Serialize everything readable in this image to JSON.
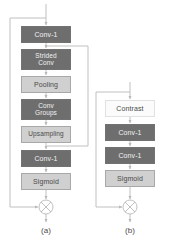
{
  "figure": {
    "background_color": "#ffffff",
    "colors": {
      "box_dark": "#6e6e6e",
      "box_light": "#d0d0d0",
      "box_white": "#fbfbfb",
      "label_dark_text": "#f2f2f2",
      "label_light_text": "#4a4a4a",
      "line": "#b9b9b9",
      "caption_text": "#4a4a4a"
    }
  },
  "panels": [
    {
      "id": "panel-a",
      "caption": "(a)",
      "nodes": [
        {
          "id": "a-conv1-top",
          "label": "Conv-1",
          "style": "dark",
          "x": 21,
          "y": 26,
          "w": 50,
          "h": 17
        },
        {
          "id": "a-strided-conv",
          "label": "Strided\nConv",
          "style": "dark",
          "x": 21,
          "y": 49,
          "w": 50,
          "h": 21
        },
        {
          "id": "a-pooling",
          "label": "Pooling",
          "style": "light",
          "x": 21,
          "y": 76,
          "w": 50,
          "h": 17
        },
        {
          "id": "a-conv-groups",
          "label": "Conv\nGroups",
          "style": "dark",
          "x": 21,
          "y": 99,
          "w": 50,
          "h": 21
        },
        {
          "id": "a-upsampling",
          "label": "Upsampling",
          "style": "light",
          "x": 21,
          "y": 126,
          "w": 50,
          "h": 17
        },
        {
          "id": "a-conv1-bottom",
          "label": "Conv-1",
          "style": "dark",
          "x": 21,
          "y": 150,
          "w": 50,
          "h": 17
        },
        {
          "id": "a-sigmoid",
          "label": "Sigmoid",
          "style": "light",
          "x": 21,
          "y": 173,
          "w": 50,
          "h": 17
        }
      ],
      "operator": {
        "id": "a-multiply",
        "symbol": "multiply",
        "cx": 46,
        "cy": 207,
        "r": 7
      },
      "caption_pos": {
        "x": 26,
        "y": 226
      }
    },
    {
      "id": "panel-b",
      "caption": "(b)",
      "nodes": [
        {
          "id": "b-contrast",
          "label": "Contrast",
          "style": "white",
          "x": 105,
          "y": 100,
          "w": 50,
          "h": 17
        },
        {
          "id": "b-conv1-first",
          "label": "Conv-1",
          "style": "dark",
          "x": 105,
          "y": 124,
          "w": 50,
          "h": 17
        },
        {
          "id": "b-conv1-second",
          "label": "Conv-1",
          "style": "dark",
          "x": 105,
          "y": 147,
          "w": 50,
          "h": 17
        },
        {
          "id": "b-sigmoid",
          "label": "Sigmoid",
          "style": "light",
          "x": 105,
          "y": 170,
          "w": 50,
          "h": 17
        }
      ],
      "operator": {
        "id": "b-multiply",
        "symbol": "multiply",
        "cx": 130,
        "cy": 207,
        "r": 7
      },
      "caption_pos": {
        "x": 110,
        "y": 226
      }
    }
  ]
}
